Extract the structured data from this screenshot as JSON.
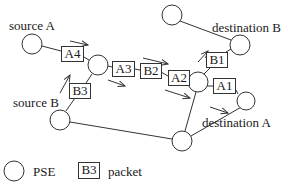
{
  "labels": {
    "source_a": "source A",
    "source_b": "source B",
    "destination_a": "destination A",
    "destination_b": "destination B"
  },
  "packets": {
    "a4": "A4",
    "a3": "A3",
    "a2": "A2",
    "a1": "A1",
    "b3": "B3",
    "b2": "B2",
    "b1": "B1"
  },
  "legend": {
    "pse_label": "PSE",
    "packet_sample": "B3",
    "packet_label": "packet"
  },
  "colors": {
    "stroke": "#333333",
    "background": "#ffffff",
    "text": "#1a1a1a"
  }
}
